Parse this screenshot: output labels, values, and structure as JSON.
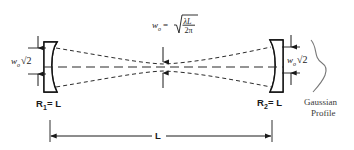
{
  "figure": {
    "type": "optical-cavity-diagram"
  },
  "labels": {
    "waist_formula": {
      "symbol": "w",
      "symbol_subscript": "o",
      "equals": "=",
      "radicand_numerator": "λL",
      "radicand_denominator": "2π",
      "full_text": "w₀ = √(λL / 2π)"
    },
    "left_spot": {
      "symbol": "w",
      "symbol_subscript": "o",
      "factor": "√2",
      "full_text": "w₀√2"
    },
    "right_spot": {
      "symbol": "w",
      "symbol_subscript": "o",
      "factor": "√2",
      "full_text": "w₀√2"
    },
    "left_mirror": {
      "symbol": "R",
      "subscript": "1",
      "equals_value": "= L",
      "full_text": "R₁ = L"
    },
    "right_mirror": {
      "symbol": "R",
      "subscript": "2",
      "equals_value": "= L",
      "full_text": "R₂ = L"
    },
    "cavity_length": "L",
    "gaussian_profile_line1": "Gaussian",
    "gaussian_profile_line2": "Profile"
  },
  "colors": {
    "ink": "#1a1a1a",
    "mirror_stroke": "#111111",
    "beam_dash": "#2b2b2b",
    "gaussian_curve": "#777777",
    "background": "#ffffff"
  }
}
